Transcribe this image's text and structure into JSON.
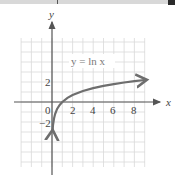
{
  "chart_data": {
    "type": "line",
    "title": "",
    "function_label": "y = ln x",
    "xlabel": "x",
    "ylabel": "y",
    "x_tick_labels": [
      "0",
      "2",
      "4",
      "6",
      "8"
    ],
    "y_tick_labels": [
      "2",
      "-2"
    ],
    "xlim": [
      -3,
      9
    ],
    "ylim": [
      -6.5,
      6.5
    ],
    "grid": true,
    "legend": null,
    "series": [
      {
        "name": "y = ln x",
        "x": [
          0.05,
          0.1,
          0.2,
          0.3,
          0.5,
          0.75,
          1,
          1.5,
          2,
          3,
          4,
          5,
          6,
          7,
          8,
          9
        ],
        "y": [
          -3.0,
          -2.3,
          -1.61,
          -1.2,
          -0.69,
          -0.29,
          0,
          0.41,
          0.69,
          1.1,
          1.39,
          1.61,
          1.79,
          1.95,
          2.08,
          2.2
        ]
      }
    ],
    "colors": {
      "curve": "#6e6e6e",
      "axis": "#555555",
      "grid": "#d9d9d9"
    }
  }
}
